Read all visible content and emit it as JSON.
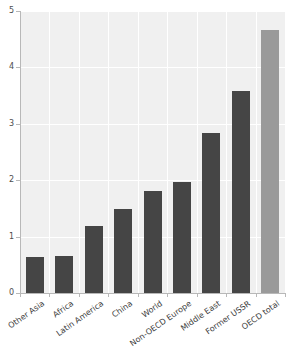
{
  "chart_data": {
    "type": "bar",
    "title": "",
    "subtitle": "",
    "xlabel": "",
    "ylabel": "",
    "categories": [
      "Other Asia",
      "Africa",
      "Latin America",
      "China",
      "World",
      "Non-OECD Europe",
      "Middle East",
      "Former USSR",
      "OECD total"
    ],
    "values": [
      0.64,
      0.65,
      1.19,
      1.49,
      1.81,
      1.97,
      2.84,
      3.58,
      4.66
    ],
    "ylim": [
      0,
      5
    ],
    "yticks": [
      0,
      1,
      2,
      3,
      4,
      5
    ],
    "ytick_labels": [
      "0",
      "1",
      "2",
      "3",
      "4",
      "5"
    ],
    "grid": true,
    "legend": "none",
    "bar_colors": [
      "#454545",
      "#454545",
      "#454545",
      "#454545",
      "#454545",
      "#454545",
      "#454545",
      "#454545",
      "#9a9a9a"
    ],
    "highlight_category": "OECD total",
    "plot_background": "#f0f0f0",
    "gridline_color": "#ffffff",
    "axis_color": "#b8b8b8",
    "tick_label_color": "#4d4d4d"
  }
}
